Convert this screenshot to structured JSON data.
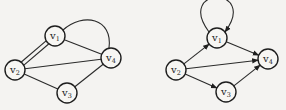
{
  "graphs": [
    {
      "name": "undirected-multigraph",
      "nodes": [
        {
          "id": "v1",
          "letter": "v",
          "sub": "1",
          "x": 55,
          "y": 36
        },
        {
          "id": "v2",
          "letter": "v",
          "sub": "2",
          "x": 15,
          "y": 70
        },
        {
          "id": "v3",
          "letter": "v",
          "sub": "3",
          "x": 67,
          "y": 93
        },
        {
          "id": "v4",
          "letter": "v",
          "sub": "4",
          "x": 111,
          "y": 58
        }
      ],
      "edges": [
        {
          "from": "v1",
          "to": "v2",
          "type": "line",
          "offset": -2
        },
        {
          "from": "v1",
          "to": "v2",
          "type": "line",
          "offset": 2
        },
        {
          "from": "v1",
          "to": "v4",
          "type": "line"
        },
        {
          "from": "v1",
          "to": "v4",
          "type": "arc"
        },
        {
          "from": "v2",
          "to": "v4",
          "type": "line"
        },
        {
          "from": "v2",
          "to": "v3",
          "type": "line"
        },
        {
          "from": "v3",
          "to": "v4",
          "type": "line"
        }
      ]
    },
    {
      "name": "directed-graph",
      "nodes": [
        {
          "id": "v1",
          "letter": "v",
          "sub": "1",
          "x": 217,
          "y": 38
        },
        {
          "id": "v2",
          "letter": "v",
          "sub": "2",
          "x": 176,
          "y": 70
        },
        {
          "id": "v3",
          "letter": "v",
          "sub": "3",
          "x": 226,
          "y": 92
        },
        {
          "id": "v4",
          "letter": "v",
          "sub": "4",
          "x": 268,
          "y": 59
        }
      ],
      "edges": [
        {
          "from": "v1",
          "to": "v1",
          "type": "loop",
          "directed": true
        },
        {
          "from": "v1",
          "to": "v4",
          "type": "line",
          "directed": true
        },
        {
          "from": "v2",
          "to": "v1",
          "type": "line",
          "directed": true
        },
        {
          "from": "v2",
          "to": "v4",
          "type": "line",
          "directed": true
        },
        {
          "from": "v2",
          "to": "v3",
          "type": "line",
          "directed": true
        },
        {
          "from": "v3",
          "to": "v4",
          "type": "line",
          "directed": true
        }
      ]
    }
  ],
  "node_radius": 10,
  "colors": {
    "stroke": "#1e1e1e",
    "background": "#f4f3f1"
  }
}
